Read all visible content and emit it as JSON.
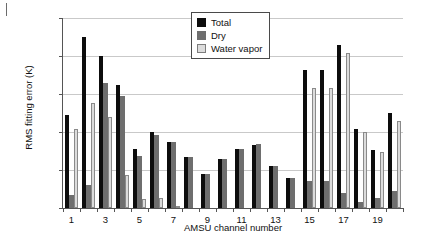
{
  "chart_data": {
    "type": "bar",
    "title": "",
    "xlabel": "AMSU channel number",
    "ylabel": "RMS fitting error (K)",
    "ylim": [
      0,
      0.1
    ],
    "yticks": [
      0,
      0.02,
      0.04,
      0.06,
      0.08,
      0.1
    ],
    "ytick_labels": [
      "0",
      "0.02",
      "0.04",
      "0.06",
      "0.08",
      "0.1"
    ],
    "grid": true,
    "legend_position": "top-center",
    "categories": [
      1,
      2,
      3,
      4,
      5,
      6,
      7,
      8,
      9,
      10,
      11,
      12,
      13,
      14,
      15,
      16,
      17,
      18,
      19,
      20
    ],
    "xtick_labels": [
      "1",
      "3",
      "5",
      "7",
      "9",
      "11",
      "13",
      "15",
      "17",
      "19"
    ],
    "xtick_positions": [
      1,
      3,
      5,
      7,
      9,
      11,
      13,
      15,
      17,
      19
    ],
    "series": [
      {
        "name": "Total",
        "color": "#0d0d0d",
        "values": [
          0.049,
          0.09,
          0.08,
          0.065,
          0.031,
          0.04,
          0.035,
          0.027,
          0.018,
          0.026,
          0.031,
          0.033,
          0.022,
          0.016,
          0.0725,
          0.0725,
          0.086,
          0.0415,
          0.0305,
          0.05
        ]
      },
      {
        "name": "Dry",
        "color": "#6e6e6e",
        "values": [
          0.007,
          0.012,
          0.066,
          0.059,
          0.0275,
          0.0385,
          0.0345,
          0.027,
          0.018,
          0.026,
          0.031,
          0.0335,
          0.022,
          0.016,
          0.014,
          0.0143,
          0.0078,
          0.003,
          0.0055,
          0.0088
        ]
      },
      {
        "name": "Water vapor",
        "color": "#dcdcdc",
        "values": [
          0.0415,
          0.0553,
          0.0478,
          0.0175,
          0.005,
          0.0055,
          0.0005,
          0.0,
          0.0,
          0.0,
          0.0,
          0.0,
          0.0,
          0.0,
          0.063,
          0.063,
          0.0818,
          0.04,
          0.0297,
          0.046
        ]
      }
    ]
  },
  "legend": {
    "items": [
      {
        "label": "Total"
      },
      {
        "label": "Dry"
      },
      {
        "label": "Water vapor"
      }
    ]
  }
}
